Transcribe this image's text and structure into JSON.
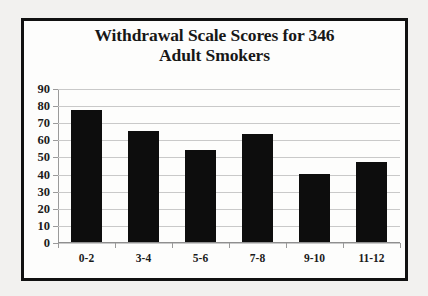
{
  "chart_data": {
    "type": "bar",
    "title": "Withdrawal Scale Scores for 346 Adult Smokers",
    "title_line1": "Withdrawal Scale Scores for 346",
    "title_line2": "Adult Smokers",
    "categories": [
      "0-2",
      "3-4",
      "5-6",
      "7-8",
      "9-10",
      "11-12"
    ],
    "values": [
      77,
      65,
      54,
      63,
      40,
      47
    ],
    "xlabel": "",
    "ylabel": "",
    "ylim": [
      0,
      90
    ],
    "ytick_step": 10,
    "yticks": [
      0,
      10,
      20,
      30,
      40,
      50,
      60,
      70,
      80,
      90
    ],
    "grid": true,
    "legend": false,
    "bar_color": "#0d0d0d",
    "grid_color": "#c9c9c9",
    "axis_color": "#9a9a9a",
    "background_color": "#fdfdfc",
    "border_color": "#111111",
    "outer_background_color": "#f2f1ef"
  }
}
